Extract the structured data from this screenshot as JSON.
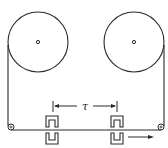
{
  "diagram": {
    "type": "tape-transport-schematic",
    "interval_label": "τ",
    "components": {
      "reels": [
        {
          "name": "supply-reel",
          "cx": 38,
          "cy": 42,
          "r": 30
        },
        {
          "name": "takeup-reel",
          "cx": 134,
          "cy": 42,
          "r": 30
        }
      ],
      "guide_rollers": [
        {
          "name": "left-guide-roller",
          "cx": 11,
          "cy": 127
        },
        {
          "name": "right-guide-roller",
          "cx": 161,
          "cy": 127
        }
      ],
      "heads": [
        {
          "name": "head-1",
          "x": 52
        },
        {
          "name": "head-2",
          "x": 117
        }
      ],
      "direction_arrow": "right"
    },
    "colors": {
      "line": "#2a2a2a",
      "background": "#ffffff"
    }
  }
}
